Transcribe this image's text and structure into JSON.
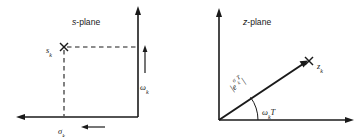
{
  "figure": {
    "name": "s-plane to z-plane pole mapping",
    "background_color": "#ffffff",
    "ink_color": "#1a1a1a",
    "width": 363,
    "height": 137
  },
  "s_plane": {
    "title_var": "s",
    "title_rest": "-plane",
    "pole_marker": "x",
    "pole_label_base": "s",
    "pole_label_sub": "k",
    "real_axis_label_base": "σ",
    "real_axis_label_sub": "k",
    "imag_axis_label_base": "ω",
    "imag_axis_label_sub": "k",
    "dashed_guides": [
      "horizontal-from-pole-to-imag-axis",
      "vertical-from-pole-to-real-axis"
    ],
    "arrows": [
      "real-axis-left-arrow",
      "imag-axis-up-arrow",
      "sigma-pointer-left",
      "omega-pointer-up"
    ]
  },
  "z_plane": {
    "title_var": "z",
    "title_rest": "-plane",
    "pole_marker": "x",
    "pole_label_base": "z",
    "pole_label_sub": "k",
    "magnitude_label": {
      "open_bar": "|",
      "base": "e",
      "sup_base": "σ",
      "sup_sub": "k",
      "sup_tail": "T",
      "close_bar": "|"
    },
    "angle_label": {
      "base": "ω",
      "sub": "k",
      "tail": "T"
    },
    "arrows": [
      "real-axis-right-arrow",
      "imag-axis-up-arrow",
      "ray-arrow-to-pole"
    ],
    "arc": "angle-arc-at-origin"
  }
}
